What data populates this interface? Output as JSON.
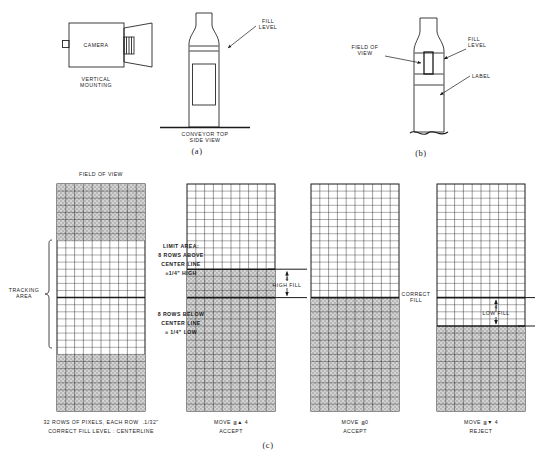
{
  "figure": {
    "title_panels": [
      "(a)",
      "(b)",
      "(c)"
    ],
    "panel_a": {
      "camera_label": "CAMERA",
      "mounting_label": "VERTICAL\nMOUNTING",
      "fill_level_label": "FILL\nLEVEL",
      "conveyor_label": "CONVEYOR TOP\nSIDE VIEW",
      "letter": "(a)"
    },
    "panel_b": {
      "field_of_view_label": "FIELD OF\nVIEW",
      "fill_level_label": "FILL\nLEVEL",
      "label_label": "LABEL",
      "letter": "(b)"
    },
    "panel_c": {
      "letter": "(c)",
      "field_of_view_label": "FIELD OF VIEW",
      "tracking_area_label": "TRACKING\nAREA",
      "limit_area": {
        "heading": "LIMIT AREA:",
        "above_line1": "8 ROWS ABOVE",
        "above_line2": "CENTER LINE",
        "above_line3": "≡1/4\" HIGH",
        "below_line1": "8 ROWS BELOW",
        "below_line2": "CENTER LINE",
        "below_line3": "≡ 1/4\" LOW"
      },
      "footnote_line1": "32 ROWS OF PIXELS, EACH ROW  .1/32\"",
      "footnote_line2": "CORRECT FILL LEVEL : CENTERLINE",
      "high_fill_label": "HIGH FILL",
      "high_fill_value": "4",
      "correct_fill_label": "CORRECT\nFILL",
      "low_fill_label": "LOW FILL",
      "low_fill_value": "4",
      "grids": [
        {
          "name": "reference-grid",
          "caption_line1": "",
          "caption_line2": "",
          "cols": 10,
          "rows": 32,
          "shaded_top_rows": 8,
          "shaded_bottom_rows": 8,
          "centerline_row": 16,
          "fill_mode": "limit-bands"
        },
        {
          "name": "high-fill-grid",
          "caption_line1": "MOVE ≦▲ 4",
          "caption_line2": "ACCEPT",
          "cols": 10,
          "rows": 32,
          "fill_start_row": 12,
          "centerline_row": 16,
          "fill_mode": "filled-below",
          "status": "ACCEPT"
        },
        {
          "name": "correct-fill-grid",
          "caption_line1": "MOVE ≦0",
          "caption_line2": "ACCEPT",
          "cols": 10,
          "rows": 32,
          "fill_start_row": 16,
          "centerline_row": 16,
          "fill_mode": "filled-below",
          "status": "ACCEPT"
        },
        {
          "name": "low-fill-grid",
          "caption_line1": "MOVE ≦▼ 4",
          "caption_line2": "REJECT",
          "cols": 10,
          "rows": 32,
          "fill_start_row": 20,
          "centerline_row": 16,
          "fill_mode": "filled-below",
          "status": "REJECT"
        }
      ]
    },
    "colors": {
      "ink": "#1a1a1a",
      "shade": "#b9b9b9",
      "paper": "#ffffff"
    }
  }
}
